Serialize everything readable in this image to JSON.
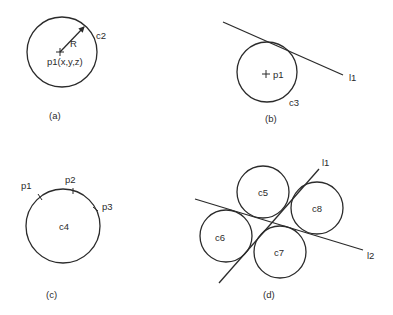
{
  "panels": {
    "a": {
      "caption": "(a)",
      "circle_label": "c2",
      "radius_label": "R",
      "center_label": "p1(x,y,z)"
    },
    "b": {
      "caption": "(b)",
      "circle_label": "c3",
      "center_label": "p1",
      "line_label": "l1"
    },
    "c": {
      "caption": "(c)",
      "circle_label": "c4",
      "points": [
        "p1",
        "p2",
        "p3"
      ]
    },
    "d": {
      "caption": "(d)",
      "circle_labels": [
        "c5",
        "c6",
        "c7",
        "c8"
      ],
      "line_labels": [
        "l1",
        "l2"
      ]
    }
  },
  "colors": {
    "stroke": "#2b2b2b",
    "background": "#ffffff"
  }
}
